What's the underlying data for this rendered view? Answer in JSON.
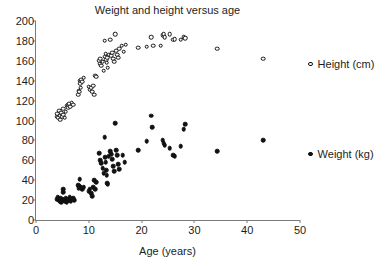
{
  "chart_data": {
    "type": "scatter",
    "title": "Weight and height versus age",
    "xlabel": "Age (years)",
    "ylabel": "",
    "xlim": [
      0,
      50
    ],
    "ylim": [
      0,
      200
    ],
    "xticks": [
      0,
      10,
      20,
      30,
      40,
      50
    ],
    "yticks": [
      0,
      20,
      40,
      60,
      80,
      100,
      120,
      140,
      160,
      180,
      200
    ],
    "grid": false,
    "legend_position": "right",
    "series": [
      {
        "name": "Height (cm)",
        "marker": "open-circle",
        "color": "#111111",
        "points": [
          [
            3.9,
            104
          ],
          [
            4.0,
            107
          ],
          [
            4.2,
            103
          ],
          [
            4.4,
            110
          ],
          [
            4.5,
            105
          ],
          [
            4.6,
            101
          ],
          [
            4.8,
            108
          ],
          [
            5.0,
            104
          ],
          [
            5.1,
            112
          ],
          [
            5.2,
            106
          ],
          [
            5.4,
            103
          ],
          [
            5.6,
            109
          ],
          [
            5.8,
            115
          ],
          [
            6.0,
            116
          ],
          [
            6.1,
            113
          ],
          [
            6.3,
            117
          ],
          [
            6.5,
            114
          ],
          [
            6.8,
            118
          ],
          [
            7.0,
            116
          ],
          [
            8.0,
            126
          ],
          [
            8.1,
            130
          ],
          [
            8.2,
            129
          ],
          [
            8.3,
            140
          ],
          [
            8.4,
            137
          ],
          [
            8.5,
            133
          ],
          [
            8.6,
            141
          ],
          [
            8.8,
            139
          ],
          [
            9.0,
            143
          ],
          [
            10.0,
            134
          ],
          [
            10.2,
            131
          ],
          [
            10.4,
            133
          ],
          [
            10.6,
            129
          ],
          [
            10.8,
            135
          ],
          [
            11.0,
            126
          ],
          [
            11.2,
            145
          ],
          [
            11.4,
            144
          ],
          [
            12.0,
            160
          ],
          [
            12.1,
            157
          ],
          [
            12.2,
            162
          ],
          [
            12.4,
            155
          ],
          [
            12.6,
            159
          ],
          [
            12.8,
            150
          ],
          [
            13.0,
            180
          ],
          [
            13.1,
            164
          ],
          [
            13.2,
            167
          ],
          [
            13.3,
            161
          ],
          [
            13.4,
            158
          ],
          [
            13.5,
            163
          ],
          [
            13.6,
            153
          ],
          [
            13.8,
            166
          ],
          [
            14.0,
            181
          ],
          [
            14.2,
            165
          ],
          [
            14.4,
            168
          ],
          [
            14.6,
            162
          ],
          [
            14.8,
            159
          ],
          [
            15.0,
            187
          ],
          [
            15.2,
            170
          ],
          [
            15.4,
            166
          ],
          [
            15.6,
            163
          ],
          [
            15.8,
            172
          ],
          [
            16.2,
            175
          ],
          [
            16.6,
            169
          ],
          [
            17.0,
            176
          ],
          [
            19.4,
            173
          ],
          [
            21.0,
            174
          ],
          [
            21.8,
            184
          ],
          [
            22.2,
            175
          ],
          [
            23.6,
            175
          ],
          [
            24.0,
            186
          ],
          [
            24.2,
            187
          ],
          [
            24.4,
            184
          ],
          [
            25.3,
            187
          ],
          [
            26.0,
            181
          ],
          [
            26.3,
            182
          ],
          [
            27.4,
            181
          ],
          [
            28.0,
            184
          ],
          [
            28.3,
            183
          ],
          [
            34.3,
            172
          ],
          [
            43.0,
            162
          ]
        ]
      },
      {
        "name": "Weight (kg)",
        "marker": "filled-circle",
        "color": "#111111",
        "points": [
          [
            3.9,
            21
          ],
          [
            4.1,
            23
          ],
          [
            4.3,
            20
          ],
          [
            4.5,
            19
          ],
          [
            4.6,
            22
          ],
          [
            4.8,
            18
          ],
          [
            5.0,
            21
          ],
          [
            5.1,
            31
          ],
          [
            5.2,
            28
          ],
          [
            5.3,
            20
          ],
          [
            5.4,
            19
          ],
          [
            5.6,
            22
          ],
          [
            5.8,
            18
          ],
          [
            6.0,
            21
          ],
          [
            6.2,
            20
          ],
          [
            6.4,
            23
          ],
          [
            6.6,
            19
          ],
          [
            6.8,
            21
          ],
          [
            7.0,
            22
          ],
          [
            7.2,
            20
          ],
          [
            8.0,
            35
          ],
          [
            8.1,
            32
          ],
          [
            8.2,
            34
          ],
          [
            8.3,
            41
          ],
          [
            8.5,
            33
          ],
          [
            8.7,
            31
          ],
          [
            9.0,
            33
          ],
          [
            10.0,
            29
          ],
          [
            10.2,
            31
          ],
          [
            10.4,
            27
          ],
          [
            10.6,
            24
          ],
          [
            10.8,
            33
          ],
          [
            11.0,
            40
          ],
          [
            11.2,
            31
          ],
          [
            11.4,
            38
          ],
          [
            12.0,
            67
          ],
          [
            12.2,
            60
          ],
          [
            12.4,
            57
          ],
          [
            12.6,
            52
          ],
          [
            12.8,
            47
          ],
          [
            13.0,
            83
          ],
          [
            13.1,
            63
          ],
          [
            13.2,
            58
          ],
          [
            13.3,
            50
          ],
          [
            13.4,
            45
          ],
          [
            13.5,
            37
          ],
          [
            13.6,
            36
          ],
          [
            13.8,
            64
          ],
          [
            14.0,
            69
          ],
          [
            14.2,
            66
          ],
          [
            14.4,
            61
          ],
          [
            14.6,
            54
          ],
          [
            14.8,
            49
          ],
          [
            15.0,
            97
          ],
          [
            15.2,
            70
          ],
          [
            15.4,
            65
          ],
          [
            15.6,
            56
          ],
          [
            15.8,
            51
          ],
          [
            16.4,
            65
          ],
          [
            16.8,
            58
          ],
          [
            19.4,
            70
          ],
          [
            21.0,
            79
          ],
          [
            21.8,
            105
          ],
          [
            22.0,
            93
          ],
          [
            24.0,
            80
          ],
          [
            24.2,
            77
          ],
          [
            24.4,
            75
          ],
          [
            25.3,
            72
          ],
          [
            26.0,
            65
          ],
          [
            26.3,
            64
          ],
          [
            27.4,
            74
          ],
          [
            28.0,
            91
          ],
          [
            28.3,
            96
          ],
          [
            34.3,
            69
          ],
          [
            43.0,
            80
          ]
        ]
      }
    ]
  }
}
